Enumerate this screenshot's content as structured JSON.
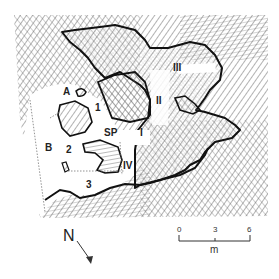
{
  "map": {
    "type": "cave plan",
    "labels": {
      "A": "A",
      "B": "B",
      "one": "1",
      "two": "2",
      "three": "3",
      "SP": "SP",
      "I": "I",
      "II": "II",
      "III": "III",
      "IV": "IV"
    },
    "north_arrow": {
      "label": "N",
      "direction": "south-east"
    },
    "scale_bar": {
      "ticks": [
        "0",
        "3",
        "6"
      ],
      "unit": "m"
    },
    "colors": {
      "rock_hatch": "#555555",
      "outline": "#111111",
      "floor_stipple": "#888888",
      "background": "#ffffff"
    }
  }
}
